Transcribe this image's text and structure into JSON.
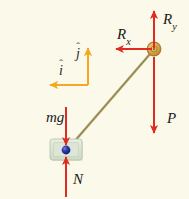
{
  "figure": {
    "kind": "free-body-diagram",
    "background_color": "#fbf9ea",
    "width": 189,
    "height": 199
  },
  "colors": {
    "force_arrow": "#e02b20",
    "unit_vector_arrow": "#f5a623",
    "rod": "#a89a5e",
    "pin_fill": "#d9ab4e",
    "pin_ring": "#a8762a",
    "block_fill": "#dfe7d8",
    "particle": "#1f2d99"
  },
  "labels": {
    "Ry": {
      "base": "R",
      "sub": "y"
    },
    "Rx": {
      "base": "R",
      "sub": "x"
    },
    "P": "P",
    "mg": "mg",
    "N": "N",
    "i_hat": {
      "base": "i",
      "hat": "ˆ"
    },
    "j_hat": {
      "base": "j",
      "hat": "ˆ"
    }
  },
  "vectors": [
    {
      "name": "Ry",
      "color": "#e02b20",
      "from": [
        154,
        48
      ],
      "to": [
        154,
        8
      ],
      "direction": "up",
      "anchor": "pin"
    },
    {
      "name": "Rx",
      "color": "#e02b20",
      "from": [
        152,
        49
      ],
      "to": [
        113,
        49
      ],
      "direction": "left",
      "anchor": "pin"
    },
    {
      "name": "P",
      "color": "#e02b20",
      "from": [
        154,
        56
      ],
      "to": [
        154,
        136
      ],
      "direction": "down",
      "anchor": "pin"
    },
    {
      "name": "mg",
      "color": "#e02b20",
      "from": [
        66,
        107
      ],
      "to": [
        66,
        148
      ],
      "direction": "down",
      "anchor": "block"
    },
    {
      "name": "N",
      "color": "#e02b20",
      "from": [
        66,
        196
      ],
      "to": [
        66,
        155
      ],
      "direction": "up",
      "anchor": "block"
    },
    {
      "name": "i_hat",
      "color": "#f5a623",
      "from": [
        88,
        85
      ],
      "to": [
        47,
        85
      ],
      "direction": "left",
      "anchor": "origin"
    },
    {
      "name": "j_hat",
      "color": "#f5a623",
      "from": [
        88,
        85
      ],
      "to": [
        88,
        45
      ],
      "direction": "up",
      "anchor": "origin"
    }
  ],
  "bodies": {
    "rod": {
      "from": [
        150,
        54
      ],
      "to": [
        67,
        150
      ]
    },
    "pin": {
      "center": [
        154,
        49
      ],
      "radius": 7
    },
    "block": {
      "x": 50,
      "y": 139,
      "width": 33,
      "height": 22
    },
    "particle": {
      "center": [
        66,
        150
      ],
      "radius": 4
    }
  }
}
